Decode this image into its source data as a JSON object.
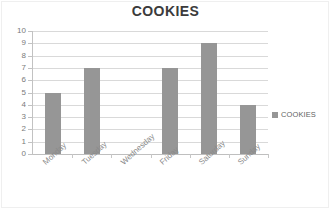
{
  "chart_data": {
    "type": "bar",
    "title": "COOKIES",
    "categories": [
      "Monday",
      "Tuesday",
      "Wednesday",
      "Friday",
      "Saturday",
      "Sunday"
    ],
    "values": [
      5,
      7,
      0,
      7,
      9,
      4
    ],
    "series": [
      {
        "name": "COOKIES",
        "values": [
          5,
          7,
          0,
          7,
          9,
          4
        ]
      }
    ],
    "xlabel": "",
    "ylabel": "",
    "ylim": [
      0,
      10
    ],
    "ytick_step": 1,
    "yticks": [
      10,
      9,
      8,
      7,
      6,
      5,
      4,
      3,
      2,
      1,
      0
    ],
    "ytick_labels": [
      "10",
      "9",
      "8",
      "7",
      "6",
      "5",
      "4",
      "3",
      "2",
      "1",
      "0"
    ],
    "grid": true,
    "grid_axis": "y",
    "legend": true,
    "legend_position": "right",
    "legend_entries": [
      "COOKIES"
    ],
    "bar_color": "#969696",
    "gridline_color": "#d9d9d9",
    "axis_color": "#c2c2c2",
    "title_color": "#3b3b3b",
    "tick_label_color": "#7a7a7a",
    "category_label_color": "#8a8a8a",
    "background_color": "#ffffff"
  },
  "legend": {
    "swatch_name": "legend-color-swatch",
    "label": "COOKIES"
  }
}
